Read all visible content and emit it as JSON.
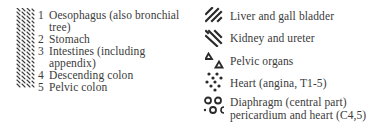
{
  "left_column": {
    "pattern_icon": "fine-diagonal-hatch",
    "items": [
      {
        "number": "1",
        "label": "Oesophagus (also bronchial",
        "continuation": "tree)"
      },
      {
        "number": "2",
        "label": "Stomach"
      },
      {
        "number": "3",
        "label": "Intestines (including",
        "continuation": "appendix)"
      },
      {
        "number": "4",
        "label": "Descending colon"
      },
      {
        "number": "5",
        "label": "Pelvic colon"
      }
    ]
  },
  "right_column": {
    "items": [
      {
        "icon": "forward-slash-hatch",
        "label": "Liver and gall bladder"
      },
      {
        "icon": "backslash-hatch",
        "label": "Kidney and ureter"
      },
      {
        "icon": "triangles",
        "label": "Pelvic organs"
      },
      {
        "icon": "dots",
        "label": "Heart (angina, T1-5)"
      },
      {
        "icon": "circles",
        "label": "Diaphragm (central part)",
        "continuation": "pericardium and heart (C4,5)"
      }
    ]
  },
  "colors": {
    "ink": "#3a3a3a",
    "background": "#ffffff"
  }
}
